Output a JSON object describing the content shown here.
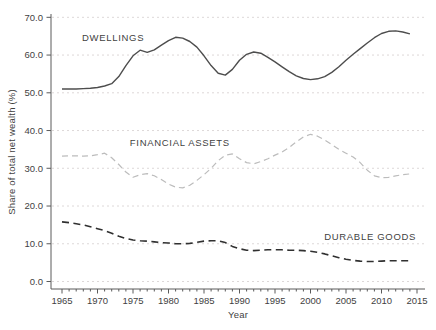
{
  "chart_data": {
    "type": "line",
    "title": "",
    "xlabel": "Year",
    "ylabel": "Share of total net wealth (%)",
    "grid": "horizontal-dashed",
    "legend": "inline-labels",
    "xlim": [
      1963.4,
      2016.2
    ],
    "ylim": [
      -2.0,
      71.0
    ],
    "x_ticks_major": [
      1965,
      1970,
      1975,
      1980,
      1985,
      1990,
      1995,
      2000,
      2005,
      2010,
      2015
    ],
    "x_minor_tick_step": 1,
    "y_ticks": [
      0,
      10,
      20,
      30,
      40,
      50,
      60,
      70
    ],
    "y_tick_labels": [
      "0.0",
      "10.0",
      "20.0",
      "30.0",
      "40.0",
      "50.0",
      "60.0",
      "70.0"
    ],
    "x": [
      1965,
      1966,
      1967,
      1968,
      1969,
      1970,
      1971,
      1972,
      1973,
      1974,
      1975,
      1976,
      1977,
      1978,
      1979,
      1980,
      1981,
      1982,
      1983,
      1984,
      1985,
      1986,
      1987,
      1988,
      1989,
      1990,
      1991,
      1992,
      1993,
      1994,
      1995,
      1996,
      1997,
      1998,
      1999,
      2000,
      2001,
      2002,
      2003,
      2004,
      2005,
      2006,
      2007,
      2008,
      2009,
      2010,
      2011,
      2012,
      2013,
      2014
    ],
    "series": [
      {
        "name": "DWELLINGS",
        "color": "#4d4d4d",
        "dash": "solid",
        "width": 1.4,
        "values": [
          51.0,
          51.0,
          51.0,
          51.1,
          51.2,
          51.4,
          51.8,
          52.4,
          54.3,
          57.2,
          59.8,
          61.3,
          60.7,
          61.4,
          62.6,
          63.8,
          64.7,
          64.5,
          63.6,
          62.1,
          59.8,
          57.2,
          55.2,
          54.7,
          56.2,
          58.6,
          60.2,
          60.8,
          60.5,
          59.4,
          58.2,
          56.9,
          55.6,
          54.5,
          53.8,
          53.5,
          53.7,
          54.3,
          55.4,
          56.9,
          58.6,
          60.2,
          61.7,
          63.2,
          64.6,
          65.7,
          66.3,
          66.4,
          66.1,
          65.6
        ]
      },
      {
        "name": "FINANCIAL ASSETS",
        "color": "#bcbcbc",
        "dash": "dashed",
        "width": 1.2,
        "values": [
          33.2,
          33.3,
          33.3,
          33.2,
          33.3,
          33.6,
          34.0,
          32.8,
          31.0,
          29.0,
          27.6,
          28.3,
          28.6,
          28.0,
          27.0,
          25.8,
          25.0,
          24.8,
          25.5,
          26.8,
          28.3,
          30.0,
          32.0,
          33.5,
          33.8,
          32.5,
          31.5,
          31.2,
          31.8,
          32.5,
          33.5,
          34.3,
          35.5,
          37.0,
          38.3,
          39.0,
          38.5,
          37.5,
          36.3,
          35.0,
          34.0,
          33.0,
          31.5,
          29.5,
          28.0,
          27.5,
          27.6,
          28.0,
          28.3,
          28.5
        ]
      },
      {
        "name": "DURABLE GOODS",
        "color": "#303030",
        "dash": "long-dash",
        "width": 1.6,
        "values": [
          15.8,
          15.6,
          15.3,
          15.0,
          14.5,
          14.0,
          13.5,
          12.8,
          12.0,
          11.4,
          11.0,
          10.8,
          10.7,
          10.5,
          10.3,
          10.2,
          10.0,
          10.0,
          10.1,
          10.4,
          10.7,
          10.8,
          10.8,
          10.3,
          9.3,
          8.7,
          8.3,
          8.2,
          8.3,
          8.4,
          8.4,
          8.4,
          8.3,
          8.3,
          8.2,
          8.0,
          7.7,
          7.3,
          6.8,
          6.3,
          5.9,
          5.6,
          5.4,
          5.3,
          5.3,
          5.4,
          5.5,
          5.5,
          5.5,
          5.5
        ]
      }
    ],
    "annotations": [
      {
        "text": "DWELLINGS",
        "year": 1972.2,
        "value": 64.4,
        "color": "#4d4d4d"
      },
      {
        "text": "FINANCIAL ASSETS",
        "year": 1981.6,
        "value": 36.8,
        "color": "#b8b8b8"
      },
      {
        "text": "DURABLE GOODS",
        "year": 2008.4,
        "value": 11.9,
        "color": "#474747"
      }
    ],
    "style_colors": {
      "spine": "#5a5a5a",
      "grid": "#ddd8d8",
      "tick_text": "#3f3f3f",
      "background": "#ffffff"
    }
  }
}
